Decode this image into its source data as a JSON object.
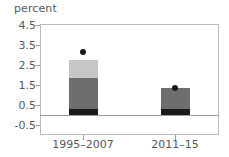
{
  "chart_data": {
    "type": "bar",
    "title": "",
    "ylabel": "percent",
    "xlabel": "",
    "stacked": true,
    "categories": [
      "1995–2007",
      "2011–15"
    ],
    "ylim": [
      -0.5,
      4.5
    ],
    "yticks": [
      "4.5",
      "3.5",
      "2.5",
      "1.5",
      "0.5",
      "-0.5"
    ],
    "ytick_values": [
      4.5,
      3.5,
      2.5,
      1.5,
      0.5,
      -0.5
    ],
    "grid": false,
    "legend": "none",
    "zero_line": 0.0,
    "series": [
      {
        "name": "bottom-segment",
        "color": "#1a1a1a",
        "values": [
          0.3,
          0.3
        ]
      },
      {
        "name": "middle-segment",
        "color": "#6e6e70",
        "values": [
          1.55,
          1.05
        ]
      },
      {
        "name": "top-segment",
        "color": "#c6c6c6",
        "values": [
          0.9,
          0.0
        ]
      }
    ],
    "totals": [
      2.75,
      1.35
    ],
    "markers": {
      "name": "total-marker",
      "color": "#1a1a1a",
      "values": [
        3.15,
        1.35
      ]
    }
  },
  "axis": {
    "ylabel": "percent"
  },
  "colors": {
    "frame": "#b9b9bb",
    "zero_line": "#9d9d9f",
    "text": "#58585a",
    "seg_dark": "#1a1a1a",
    "seg_mid": "#6e6e70",
    "seg_light": "#c6c6c6",
    "marker": "#1a1a1a"
  }
}
